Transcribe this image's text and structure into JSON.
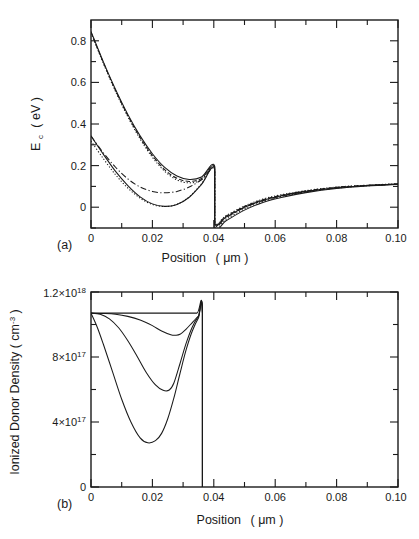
{
  "figure": {
    "background": "#ffffff",
    "ink": "#1a1a1a"
  },
  "panel_a": {
    "label": "(a)",
    "xlabel_main": "Position",
    "xlabel_unit": "( μm )",
    "ylabel_main": "E",
    "ylabel_sub": "c",
    "ylabel_unit": "( eV )",
    "xticklabels": [
      "0",
      "0.02",
      "0.04",
      "0.06",
      "0.08",
      "0.10"
    ],
    "yticklabels": [
      "0",
      "0.2",
      "0.4",
      "0.6",
      "0.8"
    ]
  },
  "panel_b": {
    "label": "(b)",
    "xlabel_main": "Position",
    "xlabel_unit": "( μm )",
    "ylabel": "Ionized Donor Density ( cm",
    "ylabel_sup": "-3",
    "ylabel_tail": " )",
    "xticklabels": [
      "0",
      "0.02",
      "0.04",
      "0.06",
      "0.08",
      "0.10"
    ],
    "yticklabels": [
      "0",
      "4×10",
      "8×10",
      "1.2×10"
    ],
    "ytick_exponents": [
      "",
      "17",
      "17",
      "18"
    ]
  },
  "chart_data": [
    {
      "type": "line",
      "panel": "a",
      "title": "",
      "xlabel": "Position ( μm )",
      "ylabel": "E_c ( eV )",
      "xlim": [
        0,
        0.1
      ],
      "ylim": [
        -0.1,
        0.9
      ],
      "xticks": [
        0,
        0.02,
        0.04,
        0.06,
        0.08,
        0.1
      ],
      "yticks": [
        0,
        0.2,
        0.4,
        0.6,
        0.8
      ],
      "minor_ticks": true,
      "grid": false,
      "legend": "none",
      "discontinuity_x": 0.0403,
      "series": [
        {
          "name": "upper-band-solid",
          "style": "solid",
          "x": [
            0.0,
            0.004,
            0.008,
            0.012,
            0.016,
            0.02,
            0.024,
            0.028,
            0.032,
            0.036,
            0.0403,
            0.0403,
            0.044,
            0.05,
            0.056,
            0.062,
            0.07,
            0.08,
            0.09,
            0.1
          ],
          "values": [
            0.845,
            0.7,
            0.566,
            0.446,
            0.343,
            0.257,
            0.191,
            0.15,
            0.133,
            0.145,
            0.197,
            -0.075,
            -0.047,
            0.0,
            0.033,
            0.055,
            0.076,
            0.094,
            0.104,
            0.112
          ]
        },
        {
          "name": "upper-band-dotted",
          "style": "dotted",
          "x": [
            0.0,
            0.004,
            0.008,
            0.012,
            0.016,
            0.02,
            0.024,
            0.028,
            0.032,
            0.036,
            0.0403,
            0.0403,
            0.044,
            0.05,
            0.056,
            0.062,
            0.07,
            0.08,
            0.09,
            0.1
          ],
          "values": [
            0.838,
            0.692,
            0.556,
            0.434,
            0.328,
            0.24,
            0.173,
            0.131,
            0.117,
            0.132,
            0.19,
            -0.068,
            -0.04,
            0.006,
            0.039,
            0.06,
            0.08,
            0.097,
            0.106,
            0.113
          ]
        },
        {
          "name": "upper-band-dashed",
          "style": "dashed",
          "x": [
            0.0,
            0.004,
            0.008,
            0.012,
            0.016,
            0.02,
            0.024,
            0.028,
            0.032,
            0.036,
            0.0403,
            0.0403,
            0.044,
            0.05,
            0.056,
            0.062,
            0.07,
            0.08,
            0.09,
            0.1
          ],
          "values": [
            0.841,
            0.696,
            0.561,
            0.44,
            0.335,
            0.248,
            0.181,
            0.139,
            0.124,
            0.138,
            0.193,
            -0.071,
            -0.043,
            0.003,
            0.036,
            0.057,
            0.078,
            0.096,
            0.105,
            0.112
          ]
        },
        {
          "name": "lower-band-solid",
          "style": "solid",
          "x": [
            0.0,
            0.004,
            0.008,
            0.012,
            0.016,
            0.02,
            0.024,
            0.028,
            0.032,
            0.036,
            0.0403,
            0.0403,
            0.044,
            0.05,
            0.056,
            0.062,
            0.07,
            0.08,
            0.09,
            0.1
          ],
          "values": [
            0.343,
            0.255,
            0.172,
            0.104,
            0.05,
            0.016,
            0.004,
            0.013,
            0.048,
            0.11,
            0.185,
            -0.097,
            -0.065,
            -0.014,
            0.023,
            0.047,
            0.07,
            0.09,
            0.102,
            0.11
          ]
        },
        {
          "name": "lower-band-dotted",
          "style": "dotted",
          "x": [
            0.0,
            0.004,
            0.008,
            0.012,
            0.016,
            0.02,
            0.024,
            0.028,
            0.032,
            0.036,
            0.0403,
            0.0403,
            0.044,
            0.05,
            0.056,
            0.062,
            0.07,
            0.08,
            0.09,
            0.1
          ],
          "values": [
            0.318,
            0.234,
            0.156,
            0.092,
            0.043,
            0.013,
            0.003,
            0.014,
            0.05,
            0.112,
            0.188,
            -0.09,
            -0.058,
            -0.008,
            0.027,
            0.051,
            0.073,
            0.092,
            0.103,
            0.111
          ]
        },
        {
          "name": "lower-band-dashdot",
          "style": "dashdot",
          "x": [
            0.0,
            0.004,
            0.008,
            0.012,
            0.016,
            0.02,
            0.024,
            0.028,
            0.032,
            0.036,
            0.0403,
            0.0403,
            0.044,
            0.05,
            0.056,
            0.062,
            0.07,
            0.08,
            0.09,
            0.1
          ],
          "values": [
            0.342,
            0.262,
            0.192,
            0.136,
            0.097,
            0.076,
            0.069,
            0.076,
            0.097,
            0.132,
            0.178,
            -0.08,
            -0.05,
            -0.002,
            0.031,
            0.053,
            0.075,
            0.093,
            0.104,
            0.111
          ]
        }
      ]
    },
    {
      "type": "line",
      "panel": "b",
      "title": "",
      "xlabel": "Position ( μm )",
      "ylabel": "Ionized Donor Density ( cm-3 )",
      "xlim": [
        0,
        0.1
      ],
      "ylim": [
        0,
        1.2e+18
      ],
      "xticks": [
        0,
        0.02,
        0.04,
        0.06,
        0.08,
        0.1
      ],
      "yticks": [
        0,
        4e+17,
        8e+17,
        1.2e+18
      ],
      "minor_ticks": true,
      "grid": false,
      "legend": "none",
      "plateau": 1.07e+18,
      "edge_x": 0.0363,
      "series": [
        {
          "name": "flat-profile",
          "style": "solid",
          "x": [
            0.0,
            0.006,
            0.012,
            0.018,
            0.024,
            0.03,
            0.0345,
            0.0363,
            0.0363
          ],
          "values": [
            1.07e+18,
            1.07e+18,
            1.07e+18,
            1.07e+18,
            1.07e+18,
            1.07e+18,
            1.07e+18,
            1.07e+18,
            0
          ]
        },
        {
          "name": "shallow-depletion",
          "style": "solid",
          "x": [
            0.0,
            0.004,
            0.008,
            0.012,
            0.016,
            0.02,
            0.023,
            0.026,
            0.0275,
            0.029,
            0.031,
            0.033,
            0.035,
            0.0363,
            0.0363
          ],
          "values": [
            1.07e+18,
            1.068e+18,
            1.063e+18,
            1.05e+18,
            1.028e+18,
            9.93e+17,
            9.6e+17,
            9.37e+17,
            9.34e+17,
            9.4e+17,
            9.72e+17,
            1.012e+18,
            1.052e+18,
            1.068e+18,
            0
          ]
        },
        {
          "name": "mid-depletion",
          "style": "solid",
          "x": [
            0.0,
            0.003,
            0.006,
            0.009,
            0.012,
            0.015,
            0.018,
            0.021,
            0.0235,
            0.0255,
            0.027,
            0.029,
            0.031,
            0.033,
            0.035,
            0.0363,
            0.0363
          ],
          "values": [
            1.07e+18,
            1.063e+18,
            1.035e+18,
            9.8e+17,
            9e+17,
            8.05e+17,
            7.05e+17,
            6.28e+17,
            5.95e+17,
            5.97e+17,
            6.4e+17,
            7.6e+17,
            8.85e+17,
            9.85e+17,
            1.05e+18,
            1.068e+18,
            0
          ]
        },
        {
          "name": "deep-depletion",
          "style": "solid",
          "x": [
            0.0,
            0.002,
            0.004,
            0.007,
            0.01,
            0.013,
            0.016,
            0.0185,
            0.021,
            0.023,
            0.025,
            0.027,
            0.029,
            0.031,
            0.033,
            0.035,
            0.0363,
            0.0363
          ],
          "values": [
            1.07e+18,
            9.85e+17,
            8.8e+17,
            7.1e+17,
            5.4e+17,
            4e+17,
            3.02e+17,
            2.72e+17,
            2.85e+17,
            3.3e+17,
            4.2e+17,
            5.48e+17,
            7e+17,
            8.45e+17,
            9.6e+17,
            1.04e+18,
            1.068e+18,
            0
          ]
        }
      ]
    }
  ]
}
